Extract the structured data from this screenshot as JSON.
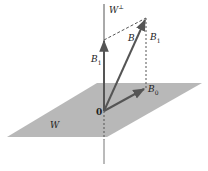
{
  "diagram": {
    "colors": {
      "plane": "#b8b8b8",
      "line": "#555555",
      "arrow": "#555555",
      "background": "#ffffff"
    },
    "labels": {
      "w_perp": "W",
      "w_perp_sup": "⊥",
      "B": "B",
      "B1_left": "B",
      "B1_left_sub": "1",
      "B1_right": "B",
      "B1_right_sub": "1",
      "B0": "B",
      "B0_sub": "0",
      "origin": "0",
      "plane": "W"
    },
    "points": {
      "origin": [
        104,
        111
      ],
      "B_tip": [
        146,
        18
      ],
      "B1_tip": [
        104,
        40
      ],
      "B0_tip": [
        146,
        88
      ]
    }
  }
}
